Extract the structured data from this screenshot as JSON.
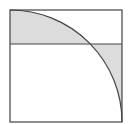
{
  "diagram": {
    "square": {
      "x": 10,
      "y": 10,
      "size": 112
    },
    "arc": {
      "center": [
        10,
        122
      ],
      "radius": 112
    },
    "horizontal_line_y": 44,
    "colors": {
      "stroke": "#444444",
      "shade": "#dcdcdc",
      "background": "#ffffff"
    }
  }
}
